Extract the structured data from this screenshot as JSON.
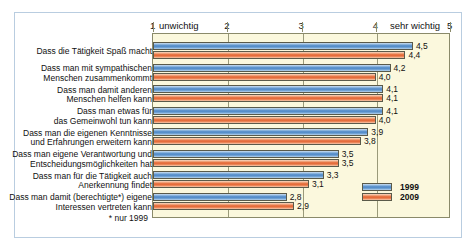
{
  "cut_header": "",
  "chart_data": {
    "type": "bar",
    "orientation": "horizontal",
    "title": "",
    "xlabel": "",
    "ylabel": "",
    "xlim": [
      1,
      5
    ],
    "grid": true,
    "legend_position": "bottom-right",
    "axis": {
      "ticks": [
        {
          "value": 1,
          "label": "1",
          "extra": "unwichtig"
        },
        {
          "value": 2,
          "label": "2",
          "extra": ""
        },
        {
          "value": 3,
          "label": "3",
          "extra": ""
        },
        {
          "value": 4,
          "label": "4",
          "extra": ""
        },
        {
          "value": 5,
          "label": "5",
          "extra": "sehr wichtig"
        }
      ],
      "low_label": "unwichtig",
      "high_label": "sehr wichtig"
    },
    "categories": [
      "Dass die Tätigkeit Spaß macht",
      "Dass man mit sympathischen\nMenschen zusammenkommt",
      "Dass man damit anderen\nMenschen helfen kann",
      "Dass man etwas für\ndas Gemeinwohl tun kann",
      "Dass man die eigenen Kenntnisse\nund Erfahrungen erweitern kann",
      "Dass man eigene Verantwortung und\nEntscheidungsmöglichkeiten hat",
      "Dass man für die Tätigkeit auch\nAnerkennung findet",
      "Dass man damit (berechtigte*) eigene\nInteressen vertreten kann"
    ],
    "series": [
      {
        "name": "1999",
        "color": "#4a84c4",
        "values": [
          4.5,
          4.2,
          4.1,
          4.1,
          3.9,
          3.5,
          3.3,
          2.8
        ],
        "labels": [
          "4,5",
          "4,2",
          "4,1",
          "4,1",
          "3,9",
          "3,5",
          "3,3",
          "2,8"
        ]
      },
      {
        "name": "2009",
        "color": "#e2602e",
        "values": [
          4.4,
          4.0,
          4.1,
          4.0,
          3.8,
          3.5,
          3.1,
          2.9
        ],
        "labels": [
          "4,4",
          "4,0",
          "4,1",
          "4,0",
          "3,8",
          "3,5",
          "3,1",
          "2,9"
        ]
      }
    ],
    "footnote": "* nur 1999"
  },
  "legend": {
    "items": [
      {
        "label": "1999"
      },
      {
        "label": "2009"
      }
    ]
  }
}
